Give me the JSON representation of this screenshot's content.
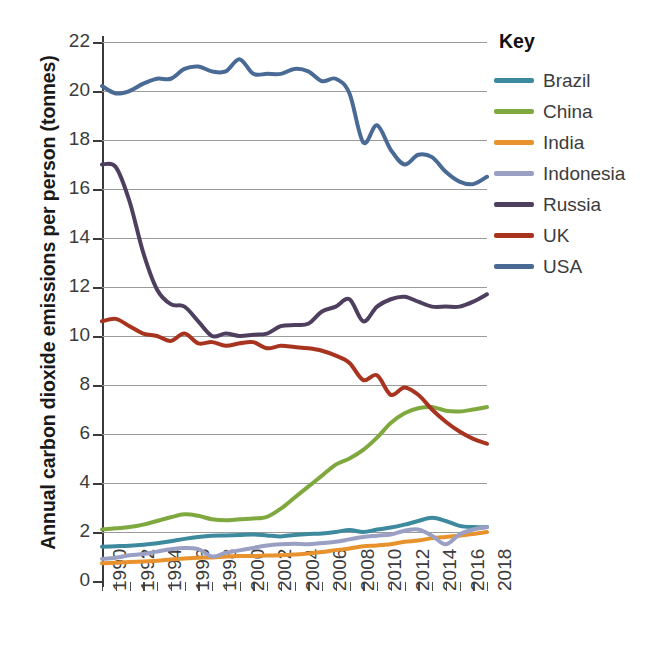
{
  "chart_data": {
    "type": "line",
    "title": "",
    "xlabel": "",
    "ylabel": "Annual carbon dioxide emissions per person (tonnes)",
    "xlim": [
      1990,
      2018
    ],
    "ylim": [
      0,
      22
    ],
    "y_tick_step": 2,
    "x_tick_step_minor": 1,
    "x_tick_step_label": 2,
    "grid": true,
    "legend_position": "right",
    "legend_title": "Key",
    "y_ticks": [
      "0",
      "2",
      "4",
      "6",
      "8",
      "10",
      "12",
      "14",
      "16",
      "18",
      "20",
      "22"
    ],
    "x_ticks": [
      "1990",
      "1992",
      "1994",
      "1996",
      "1998",
      "2000",
      "2002",
      "2004",
      "2006",
      "2008",
      "2010",
      "2012",
      "2014",
      "2016",
      "2018"
    ],
    "x": [
      1990,
      1991,
      1992,
      1993,
      1994,
      1995,
      1996,
      1997,
      1998,
      1999,
      2000,
      2001,
      2002,
      2003,
      2004,
      2005,
      2006,
      2007,
      2008,
      2009,
      2010,
      2011,
      2012,
      2013,
      2014,
      2015,
      2016,
      2017,
      2018
    ],
    "series": [
      {
        "name": "Brazil",
        "color": "#3d8a9e",
        "values": [
          1.4,
          1.42,
          1.44,
          1.48,
          1.54,
          1.62,
          1.72,
          1.8,
          1.85,
          1.86,
          1.88,
          1.9,
          1.86,
          1.82,
          1.88,
          1.92,
          1.94,
          2.0,
          2.08,
          2.0,
          2.1,
          2.18,
          2.3,
          2.45,
          2.58,
          2.45,
          2.25,
          2.2,
          2.2
        ]
      },
      {
        "name": "China",
        "color": "#7fa93f",
        "values": [
          2.1,
          2.15,
          2.2,
          2.3,
          2.45,
          2.6,
          2.72,
          2.66,
          2.52,
          2.48,
          2.52,
          2.55,
          2.62,
          2.95,
          3.4,
          3.85,
          4.3,
          4.75,
          5.0,
          5.35,
          5.85,
          6.45,
          6.85,
          7.05,
          7.1,
          6.95,
          6.92,
          7.0,
          7.1
        ]
      },
      {
        "name": "India",
        "color": "#e8922e",
        "values": [
          0.72,
          0.75,
          0.78,
          0.8,
          0.83,
          0.88,
          0.92,
          0.95,
          0.96,
          1.0,
          1.02,
          1.02,
          1.04,
          1.05,
          1.08,
          1.12,
          1.18,
          1.26,
          1.33,
          1.42,
          1.45,
          1.5,
          1.6,
          1.65,
          1.75,
          1.8,
          1.85,
          1.92,
          2.0
        ]
      },
      {
        "name": "Indonesia",
        "color": "#9a9fc4",
        "values": [
          0.9,
          0.95,
          1.05,
          1.1,
          1.2,
          1.3,
          1.35,
          1.3,
          1.0,
          1.15,
          1.25,
          1.35,
          1.45,
          1.5,
          1.52,
          1.5,
          1.55,
          1.6,
          1.7,
          1.8,
          1.85,
          1.9,
          2.05,
          2.1,
          1.85,
          1.5,
          1.9,
          2.1,
          2.2
        ]
      },
      {
        "name": "Russia",
        "color": "#4e3f5e",
        "values": [
          17.0,
          16.9,
          15.5,
          13.4,
          11.9,
          11.3,
          11.2,
          10.6,
          10.0,
          10.1,
          10.0,
          10.05,
          10.1,
          10.4,
          10.45,
          10.5,
          11.0,
          11.2,
          11.5,
          10.6,
          11.2,
          11.5,
          11.6,
          11.4,
          11.2,
          11.2,
          11.2,
          11.4,
          11.7
        ]
      },
      {
        "name": "UK",
        "color": "#a8341f",
        "values": [
          10.6,
          10.7,
          10.4,
          10.1,
          10.0,
          9.8,
          10.1,
          9.7,
          9.75,
          9.6,
          9.7,
          9.75,
          9.5,
          9.6,
          9.55,
          9.5,
          9.4,
          9.2,
          8.9,
          8.2,
          8.4,
          7.6,
          7.9,
          7.6,
          7.0,
          6.5,
          6.1,
          5.8,
          5.6
        ]
      },
      {
        "name": "USA",
        "color": "#4a6a96",
        "values": [
          20.2,
          19.9,
          20.0,
          20.3,
          20.5,
          20.5,
          20.9,
          21.0,
          20.8,
          20.8,
          21.3,
          20.7,
          20.7,
          20.7,
          20.9,
          20.8,
          20.4,
          20.5,
          19.9,
          17.9,
          18.6,
          17.6,
          17.0,
          17.4,
          17.3,
          16.7,
          16.3,
          16.2,
          16.5
        ]
      }
    ]
  },
  "legend": {
    "title": "Key",
    "items": [
      {
        "label": "Brazil",
        "color": "#3d8a9e"
      },
      {
        "label": "China",
        "color": "#7fa93f"
      },
      {
        "label": "India",
        "color": "#e8922e"
      },
      {
        "label": "Indonesia",
        "color": "#9a9fc4"
      },
      {
        "label": "Russia",
        "color": "#4e3f5e"
      },
      {
        "label": "UK",
        "color": "#a8341f"
      },
      {
        "label": "USA",
        "color": "#4a6a96"
      }
    ]
  }
}
